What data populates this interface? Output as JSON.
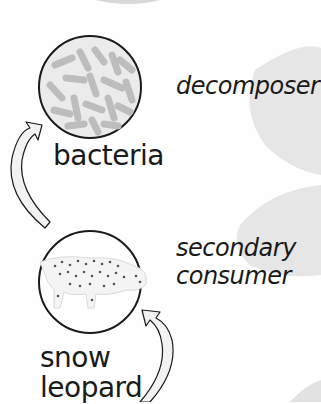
{
  "diagram": {
    "type": "food-chain",
    "nodes": [
      {
        "organism": "bacteria",
        "role": "decomposer",
        "icon": "bacteria-icon"
      },
      {
        "organism_line1": "snow",
        "organism_line2": "leopard",
        "role_line1": "secondary",
        "role_line2": "consumer",
        "icon": "snow-leopard-icon"
      }
    ],
    "arrows": [
      {
        "from": "snow leopard",
        "to": "bacteria"
      },
      {
        "from": "below (cropped)",
        "to": "snow leopard"
      }
    ],
    "colors": {
      "background": "#fefefe",
      "shape_gray": "#e4e4e4",
      "circle_stroke": "#1a1a1a",
      "arrow_fill": "#f2f2f2",
      "text": "#1a1a1a"
    }
  }
}
